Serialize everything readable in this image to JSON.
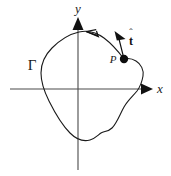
{
  "figure": {
    "background_color": "#ffffff",
    "stroke_color": "#1a1a1a",
    "axes": {
      "x_label": "x",
      "y_label": "y",
      "x_axis_y": 89,
      "y_axis_x": 78,
      "x_start": 10,
      "x_end": 152,
      "y_top": 17,
      "y_bottom": 170
    },
    "labels": {
      "curve_name": "Γ",
      "point_name": "P",
      "tangent_vector": "t",
      "tangent_hat": "ˆ"
    },
    "point_P": {
      "x": 124,
      "y": 59,
      "radius": 4.2
    },
    "tangent_vector_geometry": {
      "tail_x": 124,
      "tail_y": 59,
      "tip_x": 117,
      "tip_y": 32
    },
    "orientation_arrow": {
      "x": 89,
      "y": 33,
      "direction": "up-left",
      "meaning": "counterclockwise traversal"
    },
    "curve_path": "M 124 59 C 118 51 112 44 104 38 C 96 32 88 30 79 32 C 70 34 60 40 52 48 C 45 55 41 64 41 73 C 41 82 44 91 49 101 C 55 113 62 125 70 133 C 76 139 83 142 90 140 C 95 138.5 98 135 101 133 C 104 131 108 132 112 128 C 117 123 120 114 124 107 C 128 100 133 96 137 91 C 140 87 142 82 143 76 C 144 70 141 64 136 61 C 132 58.5 128 58 124 59 Z"
  }
}
